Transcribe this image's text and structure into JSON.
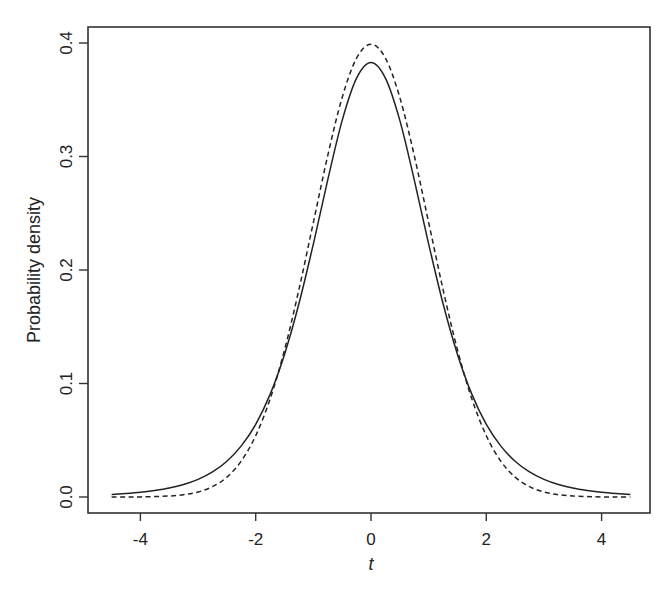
{
  "chart_data": {
    "type": "line",
    "title": "",
    "xlabel": "t",
    "ylabel": "Probability density",
    "xlim": [
      -4.7,
      4.85
    ],
    "ylim": [
      -0.016,
      0.41
    ],
    "grid": false,
    "legend": null,
    "x_ticks": [
      -4,
      -2,
      0,
      2,
      4
    ],
    "x_tick_labels": [
      "-4",
      "-2",
      "0",
      "2",
      "4"
    ],
    "y_ticks": [
      0.0,
      0.1,
      0.2,
      0.3,
      0.4
    ],
    "y_tick_labels": [
      "0.0",
      "0.1",
      "0.2",
      "0.3",
      "0.4"
    ],
    "x": [
      -4.5,
      -4.25,
      -4.0,
      -3.75,
      -3.5,
      -3.25,
      -3.0,
      -2.75,
      -2.5,
      -2.25,
      -2.0,
      -1.75,
      -1.5,
      -1.25,
      -1.0,
      -0.75,
      -0.5,
      -0.25,
      0.0,
      0.25,
      0.5,
      0.75,
      1.0,
      1.25,
      1.5,
      1.75,
      2.0,
      2.25,
      2.5,
      2.75,
      3.0,
      3.25,
      3.5,
      3.75,
      4.0,
      4.25,
      4.5
    ],
    "series": [
      {
        "name": "t distribution (solid)",
        "style": "solid",
        "color": "#222222",
        "values": [
          0.0022,
          0.003,
          0.0041,
          0.0056,
          0.0078,
          0.011,
          0.0155,
          0.0221,
          0.0315,
          0.045,
          0.064,
          0.0904,
          0.1256,
          0.1702,
          0.2231,
          0.2796,
          0.3318,
          0.369,
          0.3827,
          0.369,
          0.3318,
          0.2796,
          0.2231,
          0.1702,
          0.1256,
          0.0904,
          0.064,
          0.045,
          0.0315,
          0.0221,
          0.0155,
          0.011,
          0.0078,
          0.0056,
          0.0041,
          0.003,
          0.0022
        ]
      },
      {
        "name": "standard normal (dashed)",
        "style": "dashed",
        "color": "#222222",
        "values": [
          0.0,
          0.0,
          0.0001,
          0.0004,
          0.0009,
          0.002,
          0.0044,
          0.0091,
          0.0175,
          0.0317,
          0.054,
          0.0863,
          0.1295,
          0.1826,
          0.242,
          0.3011,
          0.3521,
          0.3867,
          0.3989,
          0.3867,
          0.3521,
          0.3011,
          0.242,
          0.1826,
          0.1295,
          0.0863,
          0.054,
          0.0317,
          0.0175,
          0.0091,
          0.0044,
          0.002,
          0.0009,
          0.0004,
          0.0001,
          0.0,
          0.0
        ]
      }
    ]
  },
  "layout": {
    "plot_box": {
      "left": 88,
      "top": 27,
      "right": 650,
      "bottom": 513
    },
    "x_px_origin": 371,
    "x_px_per_unit": 57.65,
    "y_px_origin": 497,
    "y_px_per_unit": 1135
  }
}
